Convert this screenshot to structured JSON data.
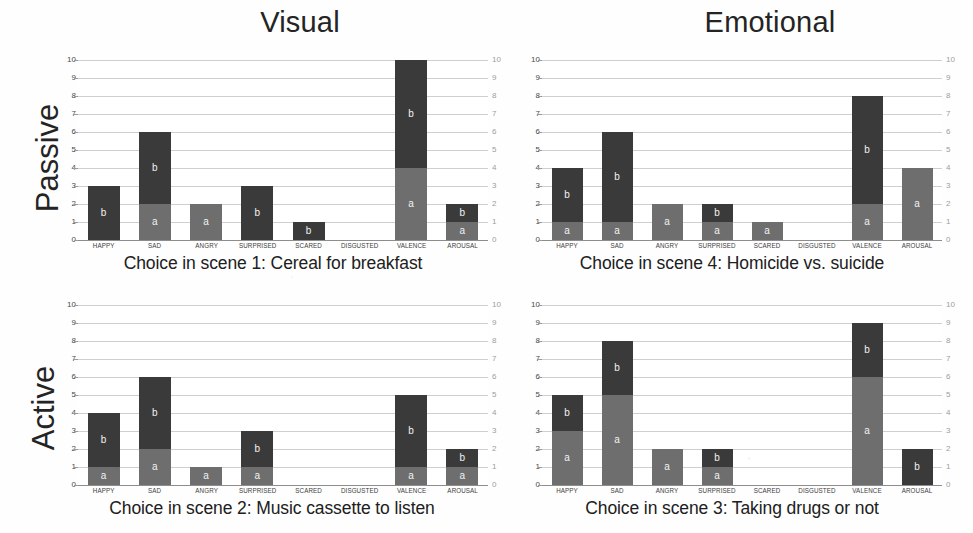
{
  "figure": {
    "column_titles": [
      "Visual",
      "Emotional"
    ],
    "row_titles": [
      "Passive",
      "Active"
    ],
    "categories": [
      "HAPPY",
      "SAD",
      "ANGRY",
      "SURPRISED",
      "SCARED",
      "DISGUSTED",
      "VALENCE",
      "AROUSAL"
    ],
    "series_labels": [
      "a",
      "b"
    ],
    "y_ticks": [
      "0",
      "1",
      "2",
      "3",
      "4",
      "5",
      "6",
      "7",
      "8",
      "9",
      "10"
    ],
    "colors": {
      "series_a": "#6e6e6e",
      "series_b": "#3a3a3a",
      "grid": "#cfcfcf",
      "axis": "#8d8d8d"
    }
  },
  "chart_data": [
    {
      "type": "bar",
      "id": "scene1",
      "title": "Choice in scene 1: Cereal for breakfast",
      "row": "Passive",
      "column": "Visual",
      "stacked": true,
      "xlabel": "",
      "ylabel": "",
      "ylim": [
        0,
        10
      ],
      "grid": true,
      "categories": [
        "HAPPY",
        "SAD",
        "ANGRY",
        "SURPRISED",
        "SCARED",
        "DISGUSTED",
        "VALENCE",
        "AROUSAL"
      ],
      "series": [
        {
          "name": "a",
          "values": [
            0,
            2,
            2,
            0,
            0,
            0,
            4,
            1
          ]
        },
        {
          "name": "b",
          "values": [
            3,
            4,
            0,
            3,
            1,
            0,
            6,
            1
          ]
        }
      ],
      "totals": [
        3,
        6,
        2,
        3,
        1,
        0,
        10,
        2
      ]
    },
    {
      "type": "bar",
      "id": "scene4",
      "title": "Choice in scene 4: Homicide vs. suicide",
      "row": "Passive",
      "column": "Emotional",
      "stacked": true,
      "xlabel": "",
      "ylabel": "",
      "ylim": [
        0,
        10
      ],
      "grid": true,
      "categories": [
        "HAPPY",
        "SAD",
        "ANGRY",
        "SURPRISED",
        "SCARED",
        "DISGUSTED",
        "VALENCE",
        "AROUSAL"
      ],
      "series": [
        {
          "name": "a",
          "values": [
            1,
            1,
            2,
            1,
            1,
            0,
            2,
            4
          ]
        },
        {
          "name": "b",
          "values": [
            3,
            5,
            0,
            1,
            0,
            0,
            6,
            0
          ]
        }
      ],
      "totals": [
        4,
        6,
        2,
        2,
        1,
        0,
        8,
        4
      ]
    },
    {
      "type": "bar",
      "id": "scene2",
      "title": "Choice in scene 2: Music cassette to listen",
      "row": "Active",
      "column": "Visual",
      "stacked": true,
      "xlabel": "",
      "ylabel": "",
      "ylim": [
        0,
        10
      ],
      "grid": true,
      "categories": [
        "HAPPY",
        "SAD",
        "ANGRY",
        "SURPRISED",
        "SCARED",
        "DISGUSTED",
        "VALENCE",
        "AROUSAL"
      ],
      "series": [
        {
          "name": "a",
          "values": [
            1,
            2,
            1,
            1,
            0,
            0,
            1,
            1
          ]
        },
        {
          "name": "b",
          "values": [
            3,
            4,
            0,
            2,
            0,
            0,
            4,
            1
          ]
        }
      ],
      "totals": [
        4,
        6,
        1,
        3,
        0,
        0,
        5,
        2
      ]
    },
    {
      "type": "bar",
      "id": "scene3",
      "title": "Choice in scene 3: Taking drugs or not",
      "row": "Active",
      "column": "Emotional",
      "stacked": true,
      "xlabel": "",
      "ylabel": "",
      "ylim": [
        0,
        10
      ],
      "grid": true,
      "categories": [
        "HAPPY",
        "SAD",
        "ANGRY",
        "SURPRISED",
        "SCARED",
        "DISGUSTED",
        "VALENCE",
        "AROUSAL"
      ],
      "series": [
        {
          "name": "a",
          "values": [
            3,
            5,
            2,
            1,
            0,
            0,
            6,
            0
          ]
        },
        {
          "name": "b",
          "values": [
            2,
            3,
            0,
            1,
            0,
            0,
            3,
            2
          ]
        }
      ],
      "totals": [
        5,
        8,
        2,
        2,
        0,
        0,
        9,
        2
      ]
    }
  ]
}
